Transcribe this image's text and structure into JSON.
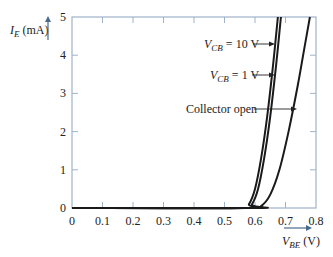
{
  "chart_data": {
    "type": "line",
    "title": "",
    "xlabel": "V_BE (V)",
    "ylabel": "I_E (mA)",
    "xlim": [
      0,
      0.8
    ],
    "ylim": [
      0,
      5
    ],
    "x_ticks": [
      "0",
      "0.1",
      "0.2",
      "0.3",
      "0.4",
      "0.5",
      "0.6",
      "0.7",
      "0.8"
    ],
    "y_ticks": [
      "0",
      "1",
      "2",
      "3",
      "4",
      "5"
    ],
    "grid": false,
    "legend": "none (curves labeled by arrow annotations)",
    "series": [
      {
        "name": "V_CB = 10 V",
        "points": [
          [
            0,
            0
          ],
          [
            0.56,
            0
          ],
          [
            0.58,
            0.1
          ],
          [
            0.6,
            0.5
          ],
          [
            0.62,
            1.3
          ],
          [
            0.64,
            2.4
          ],
          [
            0.66,
            3.8
          ],
          [
            0.675,
            5.0
          ]
        ]
      },
      {
        "name": "V_CB = 1 V",
        "points": [
          [
            0,
            0
          ],
          [
            0.57,
            0
          ],
          [
            0.59,
            0.1
          ],
          [
            0.61,
            0.5
          ],
          [
            0.63,
            1.3
          ],
          [
            0.65,
            2.4
          ],
          [
            0.67,
            3.8
          ],
          [
            0.685,
            5.0
          ]
        ]
      },
      {
        "name": "Collector open",
        "points": [
          [
            0,
            0
          ],
          [
            0.59,
            0
          ],
          [
            0.62,
            0.05
          ],
          [
            0.65,
            0.35
          ],
          [
            0.68,
            1.0
          ],
          [
            0.71,
            2.0
          ],
          [
            0.74,
            3.2
          ],
          [
            0.76,
            4.1
          ],
          [
            0.78,
            5.0
          ]
        ]
      }
    ],
    "annotations": [
      {
        "text": "V_CB = 10 V",
        "arrow_to_series": "V_CB = 10 V",
        "at_y": 4.0
      },
      {
        "text": "V_CB = 1 V",
        "arrow_to_series": "V_CB = 1 V",
        "at_y": 3.2
      },
      {
        "text": "Collector open",
        "arrow_to_series": "Collector open",
        "at_y": 2.3
      }
    ]
  },
  "labels": {
    "ylabel_main": "I",
    "ylabel_sub": "E",
    "ylabel_unit": " (mA)",
    "xlabel_main": "V",
    "xlabel_sub": "BE",
    "xlabel_unit": " (V)",
    "ann1_main": "V",
    "ann1_sub": "CB",
    "ann1_rest": " = 10 V",
    "ann2_main": "V",
    "ann2_sub": "CB",
    "ann2_rest": " = 1 V",
    "ann3": "Collector open"
  },
  "colors": {
    "axis": "#9fb3c8",
    "curve": "#1a1a1a",
    "text": "#222222"
  }
}
